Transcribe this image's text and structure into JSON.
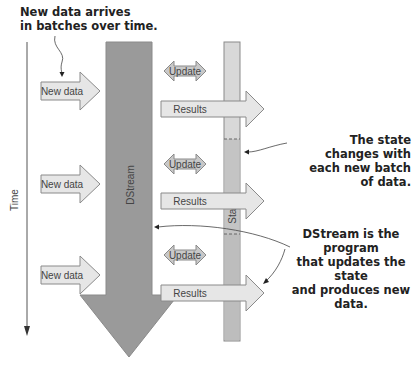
{
  "annotations": {
    "top_left": [
      "New data arrives",
      "in batches over time."
    ],
    "state_changes": [
      "The state changes with",
      "each new batch of data."
    ],
    "dstream_program": [
      "DStream is the program",
      "that updates the state",
      "and produces new data."
    ]
  },
  "axis": {
    "label": "Time"
  },
  "labels": {
    "dstream": "DStream",
    "state": "State",
    "new_data": "New data",
    "update": "Update",
    "results": "Results"
  },
  "batches": [
    {
      "new_data": "New data",
      "update": "Update",
      "results": "Results"
    },
    {
      "new_data": "New data",
      "update": "Update",
      "results": "Results"
    },
    {
      "new_data": "New data",
      "update": "Update",
      "results": "Results"
    }
  ],
  "colors": {
    "dstream_fill": "#9a9a9a",
    "state_fill": "#c4c4c4",
    "arrow_fill": "#e6e6e6",
    "update_fill": "#c8c8c8",
    "stroke": "#8a8a8a"
  }
}
